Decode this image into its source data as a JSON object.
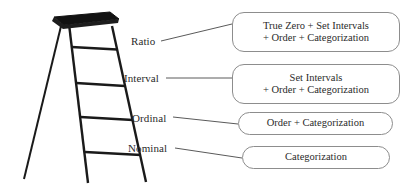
{
  "diagram": {
    "background_color": "#ffffff",
    "ink_color": "#2b2b2b",
    "box_border_color": "#8d8d8d",
    "ladder_color": "#1a1a1a"
  },
  "levels": [
    {
      "key": "ratio",
      "label": "Ratio",
      "description_lines": [
        "True Zero + Set Intervals",
        "+ Order + Categorization"
      ]
    },
    {
      "key": "interval",
      "label": "Interval",
      "description_lines": [
        "Set Intervals",
        "+ Order + Categorization"
      ]
    },
    {
      "key": "ordinal",
      "label": "Ordinal",
      "description_lines": [
        "Order + Categorization"
      ]
    },
    {
      "key": "nominal",
      "label": "Nominal",
      "description_lines": [
        "Categorization"
      ]
    }
  ],
  "ladder": {
    "name": "stepladder-illustration",
    "platform_label": "ladder-top-platform",
    "rung_count": 4,
    "rail_count": 2,
    "back_leg_count": 1
  }
}
